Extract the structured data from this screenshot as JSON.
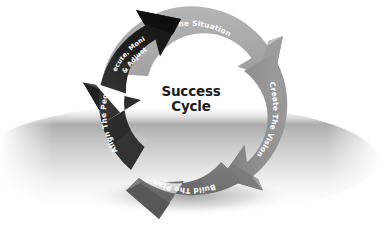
{
  "diagram": {
    "title": "Success Cycle",
    "center_label_lines": [
      "Success",
      "Cycle"
    ],
    "type": "cyclical-process-arrow-diagram",
    "direction": "clockwise",
    "background_color": "#ffffff",
    "text_color": "#ffffff",
    "center_text_color": "#1c1c1c",
    "ground_shadow_color": "#bdbdbd",
    "steps": [
      {
        "id": "assess",
        "order": 1,
        "label": "Assess The Situation",
        "position": "top",
        "color": "#a9a9a9",
        "color_dark": "#8d8d8d",
        "color_light": "#b9b9b9"
      },
      {
        "id": "vision",
        "order": 2,
        "label": "Create The Vision",
        "position": "right",
        "color": "#8c8c8c",
        "color_dark": "#6f6f6f",
        "color_light": "#9c9c9c"
      },
      {
        "id": "plan",
        "order": 3,
        "label": "Build The Plan",
        "position": "bottom",
        "color": "#6b6b6b",
        "color_dark": "#515151",
        "color_light": "#7b7b7b"
      },
      {
        "id": "align",
        "order": 4,
        "label": "Align The People",
        "position": "bottom-left",
        "color": "#2b2b2b",
        "color_dark": "#191919",
        "color_light": "#3d3d3d"
      },
      {
        "id": "execute",
        "order": 5,
        "label": "Execute, Monitor & Adjust",
        "label_lines": [
          "Execute, Monitor",
          "& Adjust"
        ],
        "position": "top-left",
        "color": "#1d1d1d",
        "color_dark": "#101010",
        "color_light": "#303030"
      }
    ]
  }
}
